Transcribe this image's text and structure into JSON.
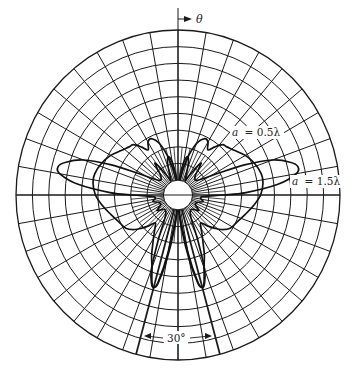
{
  "figure": {
    "type": "polar-radiation-pattern",
    "axis_label": "θ",
    "grid": {
      "rings": 10,
      "radial_spacing_deg": 10,
      "ink_color": "#1a1a1a"
    },
    "annotations": {
      "angle_span_label": "30°",
      "angle_span_deg": 30,
      "angle_span_center_deg": 180
    },
    "curves": [
      {
        "name": "a = 0.5λ",
        "label": "a = 0.5λ",
        "label_prefix": "a",
        "label_value": "= 0.5λ",
        "comment": "theta measured clockwise from top (deg), r normalized to outer ring = 1; mirrored about vertical axis",
        "points": [
          [
            0,
            0.03
          ],
          [
            8,
            0.1
          ],
          [
            14,
            0.22
          ],
          [
            20,
            0.33
          ],
          [
            26,
            0.38
          ],
          [
            30,
            0.37
          ],
          [
            34,
            0.33
          ],
          [
            38,
            0.37
          ],
          [
            42,
            0.41
          ],
          [
            46,
            0.42
          ],
          [
            52,
            0.44
          ],
          [
            60,
            0.48
          ],
          [
            68,
            0.51
          ],
          [
            76,
            0.53
          ],
          [
            82,
            0.53
          ],
          [
            90,
            0.51
          ],
          [
            98,
            0.47
          ],
          [
            106,
            0.43
          ],
          [
            114,
            0.4
          ],
          [
            122,
            0.38
          ],
          [
            128,
            0.34
          ],
          [
            132,
            0.3
          ],
          [
            136,
            0.26
          ],
          [
            140,
            0.22
          ],
          [
            144,
            0.24
          ],
          [
            148,
            0.28
          ],
          [
            152,
            0.33
          ],
          [
            156,
            0.4
          ],
          [
            160,
            0.47
          ],
          [
            163,
            0.55
          ],
          [
            165,
            0.58
          ],
          [
            167,
            0.55
          ],
          [
            170,
            0.4
          ],
          [
            174,
            0.2
          ],
          [
            180,
            0.05
          ]
        ]
      },
      {
        "name": "a = 1.5λ",
        "label": "a = 1.5λ",
        "label_prefix": "a",
        "label_value": "= 1.5λ",
        "points": [
          [
            0,
            0.02
          ],
          [
            6,
            0.12
          ],
          [
            10,
            0.2
          ],
          [
            14,
            0.24
          ],
          [
            18,
            0.21
          ],
          [
            22,
            0.14
          ],
          [
            26,
            0.1
          ],
          [
            30,
            0.13
          ],
          [
            34,
            0.2
          ],
          [
            36,
            0.24
          ],
          [
            38,
            0.22
          ],
          [
            42,
            0.16
          ],
          [
            50,
            0.14
          ],
          [
            56,
            0.17
          ],
          [
            62,
            0.28
          ],
          [
            66,
            0.45
          ],
          [
            70,
            0.62
          ],
          [
            74,
            0.72
          ],
          [
            77,
            0.76
          ],
          [
            80,
            0.74
          ],
          [
            84,
            0.62
          ],
          [
            88,
            0.42
          ],
          [
            90,
            0.28
          ],
          [
            93,
            0.16
          ],
          [
            98,
            0.14
          ],
          [
            104,
            0.16
          ],
          [
            110,
            0.13
          ],
          [
            118,
            0.12
          ],
          [
            126,
            0.16
          ],
          [
            132,
            0.13
          ],
          [
            140,
            0.12
          ],
          [
            150,
            0.16
          ],
          [
            156,
            0.3
          ],
          [
            160,
            0.48
          ],
          [
            163,
            0.56
          ],
          [
            165,
            0.58
          ],
          [
            167,
            0.54
          ],
          [
            170,
            0.35
          ],
          [
            175,
            0.12
          ],
          [
            180,
            0.03
          ]
        ]
      }
    ]
  }
}
